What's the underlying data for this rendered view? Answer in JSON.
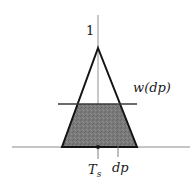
{
  "figure": {
    "background_color": "#ffffff",
    "stroke_color": "#1a1a1a",
    "axis_color": "#808080",
    "shade_color": "#7a7a7a",
    "labels": {
      "peak": "1",
      "weight": "w(",
      "weight_arg": "dp",
      "weight_close": ")",
      "center_tick": "T",
      "center_tick_sub": "s",
      "offset_tick": "dp"
    },
    "geometry": {
      "apex_x": 98,
      "apex_y": 48,
      "base_y": 147,
      "base_left_x": 62,
      "base_right_x": 137,
      "cut_line_y": 104,
      "cut_line_left_x": 58,
      "cut_line_right_x": 137,
      "axis_top_y": 15,
      "baseline_left_x": 12,
      "baseline_right_x": 190,
      "dp_x": 118,
      "ts_x": 98,
      "tick_depth": 12
    }
  }
}
